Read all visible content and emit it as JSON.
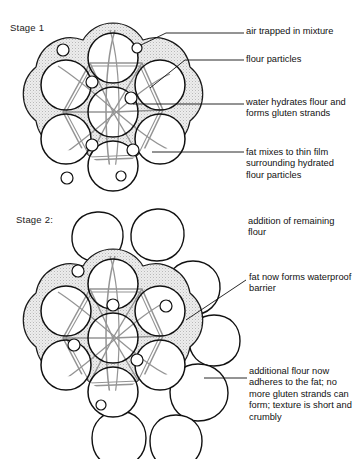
{
  "figure": {
    "top_bleed_text": "",
    "background_color": "#ffffff",
    "ink_color": "#1a1a1a",
    "fat_fill_color": "#e8e8e8",
    "gluten_color": "#8c8c8c"
  },
  "stages": [
    {
      "id": "stage1",
      "label": "Stage 1"
    },
    {
      "id": "stage2",
      "label": "Stage 2:"
    }
  ],
  "callouts": [
    {
      "id": "air",
      "text": "air trapped in mixture"
    },
    {
      "id": "flour",
      "text": "flour particles"
    },
    {
      "id": "water",
      "text": "water hydrates flour and forms gluten strands"
    },
    {
      "id": "fat",
      "text": "fat mixes to thin film surrounding hydrated flour particles"
    },
    {
      "id": "addition",
      "text": "addition of remaining flour"
    },
    {
      "id": "fatnow",
      "text": "fat now forms waterproof barrier"
    },
    {
      "id": "additional",
      "text": "additional flour now adheres to the fat; no more gluten strands can form; texture is short and crumbly"
    }
  ],
  "diagram_data": {
    "type": "diagram",
    "title": "Rubbing-in / shortening method: fat, flour, water and gluten",
    "stage1": {
      "cluster_center": [
        113,
        112
      ],
      "outer_particle_radius": 29,
      "fat_ring_thickness": 6,
      "particles": [
        {
          "cx": 113,
          "cy": 112,
          "r": 25,
          "kind": "flour-particle"
        },
        {
          "cx": 113,
          "cy": 58,
          "r": 25,
          "kind": "flour-particle"
        },
        {
          "cx": 160,
          "cy": 85,
          "r": 25,
          "kind": "flour-particle"
        },
        {
          "cx": 160,
          "cy": 139,
          "r": 25,
          "kind": "flour-particle"
        },
        {
          "cx": 113,
          "cy": 166,
          "r": 25,
          "kind": "flour-particle"
        },
        {
          "cx": 66,
          "cy": 139,
          "r": 25,
          "kind": "flour-particle"
        },
        {
          "cx": 66,
          "cy": 85,
          "r": 25,
          "kind": "flour-particle"
        }
      ],
      "air_bubbles": [
        {
          "cx": 137,
          "cy": 48,
          "r": 5
        },
        {
          "cx": 63,
          "cy": 50,
          "r": 6
        },
        {
          "cx": 92,
          "cy": 82,
          "r": 6
        },
        {
          "cx": 131,
          "cy": 98,
          "r": 6
        },
        {
          "cx": 92,
          "cy": 145,
          "r": 6
        },
        {
          "cx": 133,
          "cy": 150,
          "r": 6
        },
        {
          "cx": 121,
          "cy": 176,
          "r": 5
        },
        {
          "cx": 67,
          "cy": 178,
          "r": 6
        }
      ]
    },
    "stage2": {
      "cluster_center": [
        113,
        338
      ],
      "particles": [
        {
          "cx": 113,
          "cy": 338,
          "r": 25,
          "kind": "flour-particle"
        },
        {
          "cx": 113,
          "cy": 284,
          "r": 25,
          "kind": "flour-particle"
        },
        {
          "cx": 160,
          "cy": 311,
          "r": 25,
          "kind": "flour-particle"
        },
        {
          "cx": 160,
          "cy": 365,
          "r": 25,
          "kind": "flour-particle"
        },
        {
          "cx": 113,
          "cy": 392,
          "r": 25,
          "kind": "flour-particle"
        },
        {
          "cx": 66,
          "cy": 365,
          "r": 25,
          "kind": "flour-particle"
        },
        {
          "cx": 66,
          "cy": 311,
          "r": 25,
          "kind": "flour-particle"
        }
      ],
      "added_flour_particles": [
        {
          "cx": 97,
          "cy": 237,
          "r": 25
        },
        {
          "cx": 157,
          "cy": 235,
          "r": 26
        },
        {
          "cx": 193,
          "cy": 288,
          "r": 27
        },
        {
          "cx": 214,
          "cy": 340,
          "r": 25
        },
        {
          "cx": 198,
          "cy": 393,
          "r": 29
        },
        {
          "cx": 119,
          "cy": 437,
          "r": 26
        },
        {
          "cx": 176,
          "cy": 440,
          "r": 25
        }
      ],
      "air_bubbles": [
        {
          "cx": 78,
          "cy": 271,
          "r": 6
        },
        {
          "cx": 113,
          "cy": 305,
          "r": 6
        },
        {
          "cx": 166,
          "cy": 306,
          "r": 6
        },
        {
          "cx": 74,
          "cy": 345,
          "r": 6
        },
        {
          "cx": 137,
          "cy": 360,
          "r": 6
        },
        {
          "cx": 101,
          "cy": 405,
          "r": 5
        }
      ]
    },
    "leaders": [
      {
        "id": "air",
        "from": [
          141,
          45
        ],
        "to": [
          244,
          33
        ]
      },
      {
        "id": "flour",
        "from": [
          150,
          88
        ],
        "to": [
          244,
          60
        ]
      },
      {
        "id": "water",
        "from": [
          135,
          104
        ],
        "to": [
          244,
          104
        ]
      },
      {
        "id": "fat",
        "from": [
          152,
          152
        ],
        "to": [
          244,
          152
        ]
      },
      {
        "id": "fatnow",
        "from": [
          186,
          320
        ],
        "to": [
          246,
          280
        ]
      },
      {
        "id": "additional",
        "from": [
          204,
          378
        ],
        "to": [
          247,
          378
        ]
      }
    ]
  }
}
